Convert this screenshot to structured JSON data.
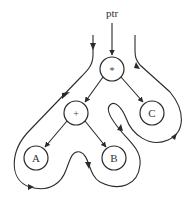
{
  "diagram": {
    "pointer_label": "ptr",
    "nodes": {
      "root": {
        "label": "*",
        "cx": 112,
        "cy": 69,
        "r": 12
      },
      "plus": {
        "label": "+",
        "cx": 76,
        "cy": 113,
        "r": 12
      },
      "c": {
        "label": "C",
        "cx": 152,
        "cy": 113,
        "r": 12
      },
      "a": {
        "label": "A",
        "cx": 36,
        "cy": 158,
        "r": 12
      },
      "b": {
        "label": "B",
        "cx": 114,
        "cy": 158,
        "r": 12
      }
    },
    "edges": [
      {
        "from": "root",
        "to": "plus"
      },
      {
        "from": "root",
        "to": "c"
      },
      {
        "from": "plus",
        "to": "a"
      },
      {
        "from": "plus",
        "to": "b"
      }
    ],
    "traversal": "Euler tour around expression tree (A + B) * C, entering left of root and exiting right"
  }
}
